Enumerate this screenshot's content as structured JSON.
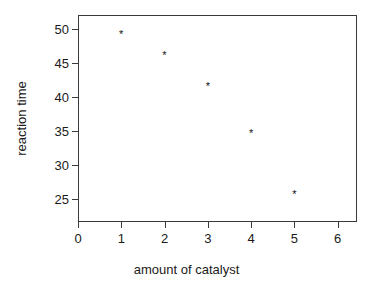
{
  "chart_data": {
    "type": "scatter",
    "title": "",
    "xlabel": "amount of catalyst",
    "ylabel": "reaction time",
    "x": [
      1,
      2,
      3,
      4,
      5
    ],
    "values": [
      49.2,
      46.2,
      41.5,
      34.6,
      25.7
    ],
    "series": [
      {
        "name": "reaction time",
        "points": [
          {
            "x": 1,
            "y": 49.2
          },
          {
            "x": 2,
            "y": 46.2
          },
          {
            "x": 3,
            "y": 41.5
          },
          {
            "x": 4,
            "y": 34.6
          },
          {
            "x": 5,
            "y": 25.7
          }
        ]
      }
    ],
    "marker": "*",
    "marker_color": "#111111",
    "xlim": [
      0,
      6.45
    ],
    "ylim": [
      21.6,
      52.1
    ],
    "xticks": [
      0,
      1,
      2,
      3,
      4,
      5,
      6
    ],
    "xtick_labels": [
      "0",
      "1",
      "2",
      "3",
      "4",
      "5",
      "6"
    ],
    "yticks": [
      25,
      30,
      35,
      40,
      45,
      50
    ],
    "ytick_labels": [
      "25",
      "30",
      "35",
      "40",
      "45",
      "50"
    ],
    "grid": false,
    "legend": null,
    "frame_color": "#3a3a3a",
    "background": "#ffffff"
  }
}
